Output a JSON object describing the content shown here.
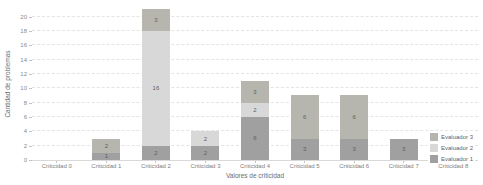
{
  "chart_data": {
    "type": "bar",
    "stacked": true,
    "title": "",
    "xlabel": "Valores de criticidad",
    "ylabel": "Cantidad de problemas",
    "categories": [
      "Criticidad 0",
      "Criticidad 1",
      "Criticidad 2",
      "Criticidad 3",
      "Criticidad 4",
      "Criticidad 5",
      "Criticidad 6",
      "Criticidad 7",
      "Criticidad 8"
    ],
    "series": [
      {
        "name": "Evaluador 1",
        "color": "#a0a0a0",
        "values": [
          0,
          1,
          2,
          2,
          6,
          3,
          3,
          3,
          0
        ]
      },
      {
        "name": "Evaluador 2",
        "color": "#d8d8d8",
        "values": [
          0,
          0,
          16,
          2,
          2,
          0,
          0,
          0,
          0
        ]
      },
      {
        "name": "Evaluador 3",
        "color": "#b6b6ae",
        "values": [
          0,
          2,
          3,
          0,
          3,
          6,
          6,
          0,
          0
        ]
      }
    ],
    "totals": [
      0,
      3,
      21,
      4,
      11,
      9,
      9,
      3,
      0
    ],
    "yticks": [
      0,
      2,
      4,
      6,
      8,
      10,
      12,
      14,
      16,
      18,
      20
    ],
    "ylim": [
      0,
      21.2
    ],
    "grid": true,
    "show_segment_labels": true,
    "legend_position": "bottom-right",
    "legend_order": [
      "Evaluador 3",
      "Evaluador 2",
      "Evaluador 1"
    ],
    "colors": {
      "gridline": "#e4e4e4",
      "axis_line": "#d9d9d9",
      "tick_text": "#8a8a8a",
      "label_text": "#5f5f5f",
      "background": "#ffffff"
    }
  }
}
